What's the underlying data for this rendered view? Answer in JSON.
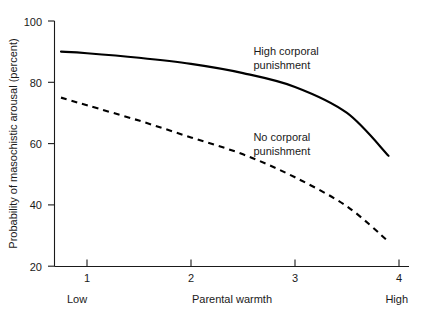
{
  "chart_data": {
    "type": "line",
    "title": "",
    "xlabel": "Parental warmth",
    "ylabel": "Probability of masochistic arousal (percent)",
    "xlim": [
      0.62,
      4.1
    ],
    "ylim": [
      17,
      103
    ],
    "grid": false,
    "legend_position": "inline-annotations",
    "x_ticks": [
      "1",
      "2",
      "3",
      "4"
    ],
    "x_tick_values": [
      1,
      2,
      3,
      4
    ],
    "y_ticks": [
      "20",
      "40",
      "60",
      "80",
      "100"
    ],
    "y_tick_values": [
      20,
      40,
      60,
      80,
      100
    ],
    "x_axis_end_labels": {
      "low": "Low",
      "high": "High"
    },
    "x": [
      0.75,
      1.0,
      1.5,
      2.0,
      2.5,
      3.0,
      3.5,
      3.9
    ],
    "series": [
      {
        "name": "High corporal punishment",
        "style": "solid",
        "color": "#000000",
        "values": [
          90,
          89.5,
          88,
          86,
          83,
          78.5,
          70,
          56
        ]
      },
      {
        "name": "No corporal punishment",
        "style": "dashed",
        "color": "#000000",
        "values": [
          75,
          72.5,
          67.5,
          62,
          56.5,
          49,
          39.5,
          28
        ]
      }
    ],
    "annotations": [
      {
        "id": "high-corporal-punishment-label",
        "line1": "High corporal",
        "line2": "punishment",
        "x": 2.6,
        "y": 89
      },
      {
        "id": "no-corporal-punishment-label",
        "line1": "No corporal",
        "line2": "punishment",
        "x": 2.6,
        "y": 61
      }
    ]
  }
}
